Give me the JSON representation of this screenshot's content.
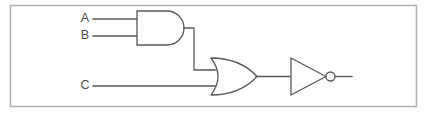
{
  "figure": {
    "kind": "logic-circuit-diagram",
    "width": 427,
    "height": 114,
    "background_color": "#ffffff",
    "border_color": "#b2b2b2",
    "line_color": "#58585a",
    "label_color": "#4a4a4c"
  },
  "labels": {
    "input_a": "A",
    "input_b": "B",
    "input_c": "C"
  },
  "gates": [
    {
      "id": "and-gate",
      "type": "AND",
      "inputs": [
        "A",
        "B"
      ],
      "output": "AND_OUT"
    },
    {
      "id": "or-gate",
      "type": "OR",
      "inputs": [
        "AND_OUT",
        "C"
      ],
      "output": "OR_OUT"
    },
    {
      "id": "not-gate",
      "type": "NOT",
      "inputs": [
        "OR_OUT"
      ],
      "output": "OUT"
    }
  ],
  "geometry": {
    "frame": {
      "x": 10.5,
      "y": 5.5,
      "width": 406,
      "height": 101
    },
    "and_gate": {
      "left": 137,
      "top": 11,
      "bottom": 45,
      "tip": 185
    },
    "or_gate": {
      "left": 211,
      "top": 58,
      "bottom": 95,
      "tip": 257
    },
    "not_gate": {
      "left": 291,
      "top": 58,
      "bottom": 95,
      "tip": 326,
      "bubble_cx": 330.5,
      "bubble_cy": 76.5,
      "bubble_r": 4.5
    },
    "wire_a": {
      "y": 19,
      "x1": 93,
      "x2": 137
    },
    "wire_b": {
      "y": 36,
      "x1": 93,
      "x2": 137
    },
    "wire_c": {
      "y": 86,
      "x1": 93,
      "x2": 216
    },
    "wire_and_to_or": {
      "x_from": 185,
      "y_from": 28,
      "x_corner": 194,
      "y_to": 70,
      "x_to": 216
    },
    "wire_or_to_not": {
      "y": 76.5,
      "x1": 257,
      "x2": 291
    },
    "wire_output": {
      "y": 76.5,
      "x1": 335,
      "x2": 352
    },
    "label_a": {
      "x": 85,
      "y": 19
    },
    "label_b": {
      "x": 85,
      "y": 36
    },
    "label_c": {
      "x": 85,
      "y": 86
    }
  }
}
